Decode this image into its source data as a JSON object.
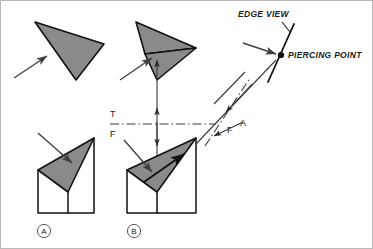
{
  "figure": {
    "background_color": "#ffffff",
    "plane_fill_color": "#8a8a8a",
    "line_color": "#111111",
    "frame_color": "#b9b9b9"
  },
  "annotations": {
    "edge_view": "EDGE VIEW",
    "piercing_point": "PIERCING POINT"
  },
  "fold_lines": {
    "horizontal": {
      "top_label": "T",
      "bottom_label": "F"
    },
    "inclined": {
      "lower_label": "F",
      "upper_label": "A"
    }
  },
  "view_labels": [
    {
      "id": "a",
      "text": "A"
    },
    {
      "id": "b",
      "text": "B"
    }
  ],
  "icons": {
    "pointer_arrow": "arrow-icon",
    "projector_arrow": "projection-arrow-icon",
    "piercing_dot": "point-marker-icon"
  }
}
